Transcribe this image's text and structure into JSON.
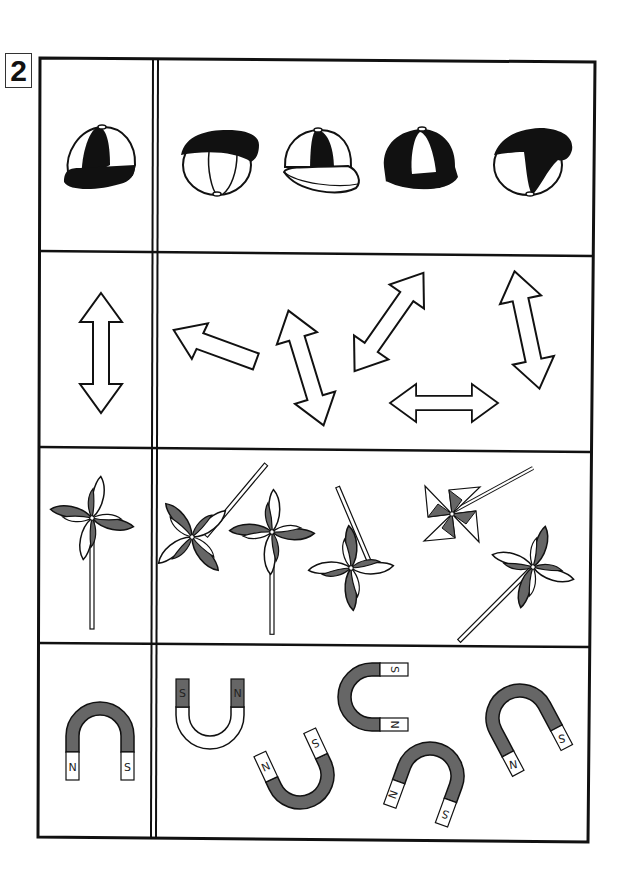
{
  "problem_number": "2",
  "colors": {
    "ink": "#111111",
    "gray_fill": "#666666",
    "paper": "#ffffff"
  },
  "rows": [
    {
      "name": "caps",
      "reference": {
        "item": "cap",
        "icon": "baseball-cap-icon"
      },
      "options": [
        {
          "item": "cap",
          "icon": "baseball-cap-icon",
          "view": "front-tilted"
        },
        {
          "item": "cap",
          "icon": "baseball-cap-icon",
          "view": "right-facing"
        },
        {
          "item": "cap",
          "icon": "baseball-cap-icon",
          "view": "inverted-colors"
        },
        {
          "item": "cap",
          "icon": "baseball-cap-icon",
          "view": "upside-down"
        }
      ]
    },
    {
      "name": "arrows",
      "reference": {
        "item": "double-arrow",
        "icon": "double-arrow-icon"
      },
      "options": [
        {
          "item": "single-arrow",
          "icon": "arrow-left-icon"
        },
        {
          "item": "double-arrow",
          "icon": "double-arrow-icon"
        },
        {
          "item": "double-arrow",
          "icon": "double-arrow-icon"
        },
        {
          "item": "double-arrow",
          "icon": "double-arrow-icon"
        },
        {
          "item": "double-arrow",
          "icon": "double-arrow-icon"
        }
      ]
    },
    {
      "name": "pinwheels",
      "reference": {
        "item": "pinwheel",
        "icon": "pinwheel-icon"
      },
      "options": [
        {
          "item": "pinwheel",
          "icon": "pinwheel-icon"
        },
        {
          "item": "pinwheel",
          "icon": "pinwheel-icon"
        },
        {
          "item": "pinwheel",
          "icon": "pinwheel-icon"
        },
        {
          "item": "pinwheel",
          "icon": "triangle-pinwheel-icon"
        },
        {
          "item": "pinwheel",
          "icon": "pinwheel-icon"
        }
      ]
    },
    {
      "name": "magnets",
      "reference": {
        "item": "magnet",
        "icon": "horseshoe-magnet-icon",
        "poles": [
          "N",
          "S"
        ]
      },
      "options": [
        {
          "item": "magnet",
          "icon": "horseshoe-magnet-icon",
          "poles": [
            "S",
            "N"
          ]
        },
        {
          "item": "magnet",
          "icon": "horseshoe-magnet-icon",
          "poles": [
            "N",
            "S"
          ]
        },
        {
          "item": "magnet",
          "icon": "horseshoe-magnet-icon",
          "poles": [
            "S",
            "N"
          ]
        },
        {
          "item": "magnet",
          "icon": "horseshoe-magnet-icon",
          "poles": [
            "N",
            "S"
          ]
        },
        {
          "item": "magnet",
          "icon": "horseshoe-magnet-icon",
          "poles": [
            "N",
            "S"
          ]
        }
      ]
    }
  ],
  "pole_labels": {
    "north": "N",
    "south": "S"
  }
}
